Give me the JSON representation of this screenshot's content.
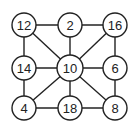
{
  "diagram": {
    "type": "graph",
    "nodes": [
      {
        "id": "n12",
        "label": "12",
        "x": 24,
        "y": 25,
        "r": 12
      },
      {
        "id": "n2",
        "label": "2",
        "x": 70,
        "y": 25,
        "r": 12
      },
      {
        "id": "n16",
        "label": "16",
        "x": 115,
        "y": 25,
        "r": 12
      },
      {
        "id": "n14",
        "label": "14",
        "x": 24,
        "y": 68,
        "r": 12
      },
      {
        "id": "n10",
        "label": "10",
        "x": 70,
        "y": 68,
        "r": 13
      },
      {
        "id": "n6",
        "label": "6",
        "x": 115,
        "y": 68,
        "r": 12
      },
      {
        "id": "n4",
        "label": "4",
        "x": 24,
        "y": 108,
        "r": 12
      },
      {
        "id": "n18",
        "label": "18",
        "x": 70,
        "y": 108,
        "r": 12
      },
      {
        "id": "n8",
        "label": "8",
        "x": 115,
        "y": 108,
        "r": 12
      }
    ],
    "edges": [
      [
        "n12",
        "n2"
      ],
      [
        "n2",
        "n16"
      ],
      [
        "n12",
        "n14"
      ],
      [
        "n14",
        "n4"
      ],
      [
        "n16",
        "n6"
      ],
      [
        "n6",
        "n8"
      ],
      [
        "n4",
        "n18"
      ],
      [
        "n18",
        "n8"
      ],
      [
        "n12",
        "n10"
      ],
      [
        "n2",
        "n10"
      ],
      [
        "n16",
        "n10"
      ],
      [
        "n14",
        "n10"
      ],
      [
        "n10",
        "n6"
      ],
      [
        "n10",
        "n4"
      ],
      [
        "n10",
        "n18"
      ],
      [
        "n10",
        "n8"
      ]
    ],
    "colors": {
      "stroke": "#222222",
      "fill": "#ffffff",
      "text": "#222222"
    }
  }
}
